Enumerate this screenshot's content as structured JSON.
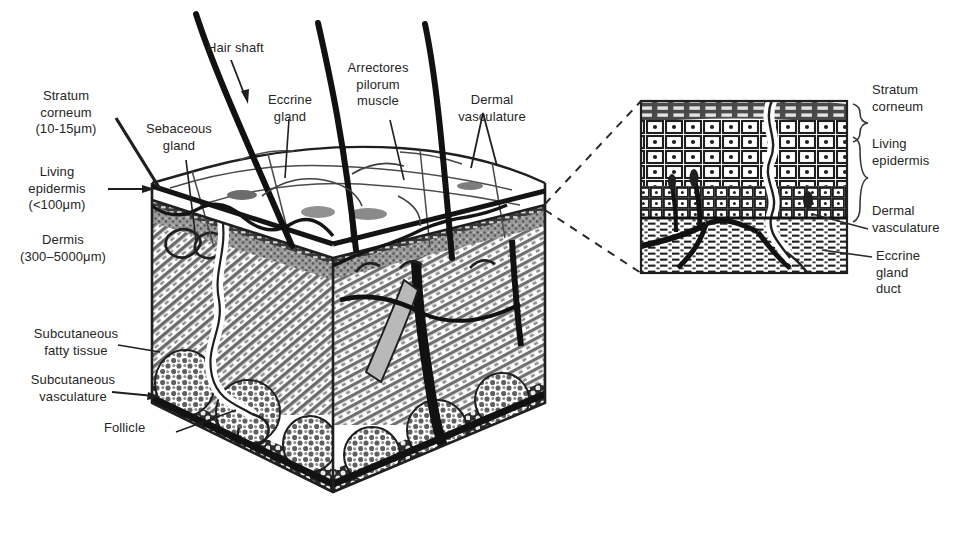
{
  "figure": {
    "style": "black-and-white halftone line drawing",
    "colors": {
      "ink": "#1a1a1a",
      "text": "#262626",
      "background": "#ffffff",
      "hatch_gray": "#8a8a8a",
      "stipple_gray": "#6e6e6e",
      "light_gray": "#c9c9c9"
    }
  },
  "main_block": {
    "labels": {
      "stratum_corneum": "Stratum\ncorneum\n(10-15μm)",
      "living_epidermis": "Living\nepidermis\n(<100μm)",
      "dermis": "Dermis\n(300–5000μm)",
      "subcutaneous_fatty_tissue": "Subcutaneous\nfatty tissue",
      "subcutaneous_vasculature": "Subcutaneous\nvasculature",
      "follicle": "Follicle",
      "sebaceous_gland": "Sebaceous\ngland",
      "hair_shaft": "Hair shaft",
      "eccrine_gland": "Eccrine\ngland",
      "arrectores_pilorum_muscle": "Arrectores\npilorum\nmuscle",
      "dermal_vasculature": "Dermal\nvasculature"
    }
  },
  "inset": {
    "labels": {
      "stratum_corneum": "Stratum\ncorneum",
      "living_epidermis": "Living\nepidermis",
      "dermal_vasculature": "Dermal\nvasculature",
      "eccrine_gland_duct": "Eccrine\ngland\nduct"
    }
  }
}
